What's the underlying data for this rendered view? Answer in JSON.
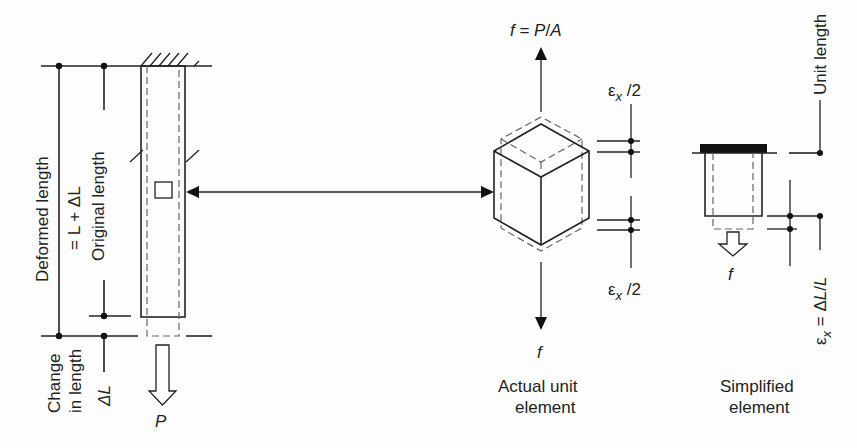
{
  "figure": {
    "bar": {
      "deformed_length_label": "Deformed length",
      "deformed_length_eq": "= L + ΔL",
      "original_length_label": "Original length",
      "change_label_line1": "Change",
      "change_label_line2": "in length",
      "change_symbol": "ΔL",
      "load_label": "P"
    },
    "actual_element": {
      "stress_top": "f = P/A",
      "stress_bottom": "f",
      "strain_top": "εx /2",
      "strain_bottom": "εx /2",
      "caption_line1": "Actual unit",
      "caption_line2": "element"
    },
    "simplified_element": {
      "unit_length_label": "Unit length",
      "strain_label": "εx = ΔL/L",
      "load_label": "f",
      "caption_line1": "Simplified",
      "caption_line2": "element"
    }
  }
}
